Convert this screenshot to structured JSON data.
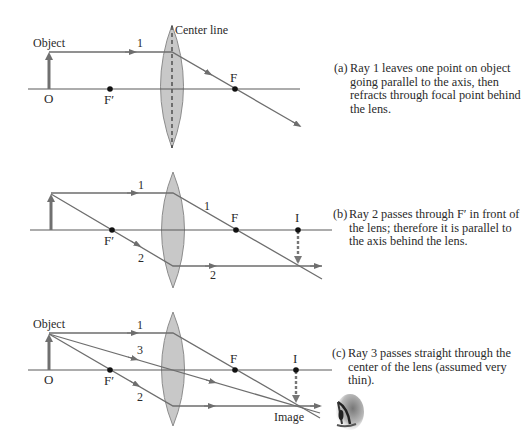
{
  "colors": {
    "ray": "#6e6e6e",
    "axis": "#5a5a5a",
    "lens_fill": "#c8c8c8",
    "lens_stroke": "#8c8c8c",
    "object_arrow": "#707070",
    "dot": "#111111",
    "text": "#2a2a2a"
  },
  "panel_a": {
    "object_label": "Object",
    "origin_label": "O",
    "f_prime_label": "F′",
    "f_label": "F",
    "center_line_label": "Center line",
    "ray1_label": "1",
    "caption_tag": "(a)",
    "caption_text": "Ray 1 leaves one point on object going parallel to the axis, then refracts through focal point behind the lens."
  },
  "panel_b": {
    "f_prime_label": "F′",
    "f_label": "F",
    "image_label": "I",
    "ray1_label_before": "1",
    "ray1_label_after": "1",
    "ray2_label_before": "2",
    "ray2_label_after": "2",
    "caption_tag": "(b)",
    "caption_text": "Ray 2 passes through F′ in front of the lens; therefore it is parallel to the axis behind the lens."
  },
  "panel_c": {
    "object_label": "Object",
    "origin_label": "O",
    "f_prime_label": "F′",
    "f_label": "F",
    "image_point_label": "I",
    "image_label": "Image",
    "ray1_label": "1",
    "ray2_label": "2",
    "ray3_label": "3",
    "eye_icon": "eye-icon",
    "caption_tag": "(c)",
    "caption_text": "Ray 3 passes straight through the center of the lens (assumed very thin)."
  }
}
